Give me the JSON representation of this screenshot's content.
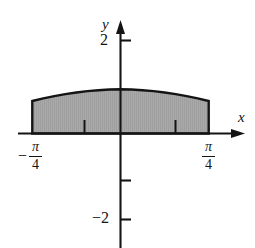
{
  "figure": {
    "background_color": "#ffffff",
    "line_color": "#141414"
  },
  "axes": {
    "x_axis_label": "x",
    "y_axis_label": "y",
    "x_axis": {
      "name": "x-axis",
      "has_arrow_right": true,
      "has_arrow_left": false
    },
    "y_axis": {
      "name": "y-axis",
      "has_arrow_top": true,
      "has_arrow_bottom": false
    }
  },
  "tick_labels": {
    "y_positive": "2",
    "y_negative": "−2",
    "x_left_sign": "−",
    "x_left_numerator": "π",
    "x_left_denominator": "4",
    "x_right_numerator": "π",
    "x_right_denominator": "4"
  },
  "region": {
    "fill_color": "#a8a8a8",
    "outline_color": "#141414",
    "label": "shaded region"
  },
  "chart_data": {
    "type": "area",
    "title": "",
    "subtitle": "",
    "xlabel": "x",
    "ylabel": "y",
    "xlim": [
      -1.1,
      1.25
    ],
    "ylim": [
      -2.6,
      2.6
    ],
    "grid": false,
    "legend": null,
    "x_tick_labels": [
      "−π/4",
      "π/4"
    ],
    "x_tick_values": [
      -0.7853981634,
      0.7853981634
    ],
    "y_tick_labels": [
      "2",
      "",
      "−2"
    ],
    "y_tick_values": [
      2,
      -1,
      -2
    ],
    "minor_x_ticks": [
      -0.3926990817,
      0.3926990817
    ],
    "series": [
      {
        "name": "upper boundary curve",
        "description": "arch peaking at center, symmetric about y-axis",
        "x": [
          -0.785,
          -0.687,
          -0.589,
          -0.491,
          -0.393,
          -0.295,
          -0.196,
          -0.098,
          0.0,
          0.098,
          0.196,
          0.295,
          0.393,
          0.491,
          0.589,
          0.687,
          0.785
        ],
        "y": [
          0.99,
          1.07,
          1.14,
          1.2,
          1.25,
          1.29,
          1.32,
          1.34,
          1.35,
          1.34,
          1.32,
          1.29,
          1.25,
          1.2,
          1.14,
          1.07,
          0.99
        ]
      },
      {
        "name": "lower boundary",
        "description": "x-axis from -pi/4 to pi/4",
        "x": [
          -0.785,
          0.785
        ],
        "y": [
          0,
          0
        ]
      }
    ],
    "shaded_region": {
      "x_start": -0.7853981634,
      "x_end": 0.7853981634,
      "y_lower": 0,
      "fill": "#a8a8a8"
    }
  }
}
